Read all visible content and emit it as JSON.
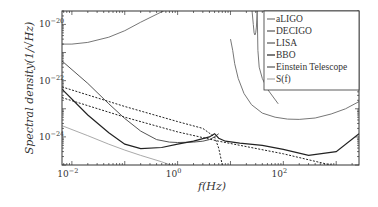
{
  "chart_data": {
    "type": "line",
    "title": "",
    "xlabel": "f(Hz)",
    "ylabel": "Spectral density(1/√Hz)",
    "xscale": "log",
    "yscale": "log",
    "xlim": [
      0.0065,
      2700
    ],
    "ylim": [
      1e-25,
      3e-20
    ],
    "x_ticks": [
      {
        "value": 0.01,
        "label": "10",
        "exp": "−2"
      },
      {
        "value": 1,
        "label": "10",
        "exp": "0"
      },
      {
        "value": 100,
        "label": "10",
        "exp": "2"
      }
    ],
    "y_ticks": [
      {
        "value": 1e-20,
        "label": "10",
        "exp": "−20"
      },
      {
        "value": 1e-22,
        "label": "10",
        "exp": "−22"
      },
      {
        "value": 1e-24,
        "label": "10",
        "exp": "−24"
      }
    ],
    "grid": false,
    "legend_position": "upper right",
    "series": [
      {
        "name": "aLIGO",
        "color": "#777777",
        "width": 1,
        "dash": "",
        "x": [
          10,
          11,
          12,
          14,
          18,
          25,
          40,
          70,
          120,
          200,
          400,
          800,
          1500,
          2700
        ],
        "y": [
          3e-21,
          1.2e-21,
          4e-22,
          1.2e-22,
          3.5e-23,
          1.4e-23,
          7e-24,
          5e-24,
          4.3e-24,
          4.2e-24,
          4.7e-24,
          6.5e-24,
          1e-23,
          1.8e-23
        ]
      },
      {
        "name": "DECIGO",
        "color": "#555555",
        "width": 1,
        "dash": "",
        "x": [
          0.0065,
          0.02,
          0.05,
          0.1,
          0.2,
          0.4,
          0.7,
          1,
          2,
          3,
          4,
          5,
          6
        ],
        "y": [
          5e-22,
          8e-23,
          1.5e-23,
          4.5e-24,
          1.6e-24,
          8e-25,
          6.5e-25,
          6.3e-25,
          6.5e-25,
          7e-25,
          8e-25,
          1e-24,
          1.3e-24
        ]
      },
      {
        "name": "LISA",
        "color": "#777777",
        "width": 1,
        "dash": "",
        "x": [
          0.0065,
          0.01,
          0.02,
          0.05,
          0.1,
          0.2,
          0.5,
          1,
          2,
          3
        ],
        "y": [
          2e-21,
          2e-21,
          2.3e-21,
          3.5e-21,
          6e-21,
          1.2e-20,
          2.8e-20,
          5.5e-20,
          1.1e-19,
          1.6e-19
        ]
      },
      {
        "name": "BBO",
        "color": "#222222",
        "width": 1.2,
        "dash": "",
        "x": [
          0.0065,
          0.02,
          0.05,
          0.1,
          0.2,
          0.5,
          1,
          2,
          4,
          5,
          6,
          8,
          15,
          40,
          100,
          300,
          1000,
          2700
        ],
        "y": [
          5e-23,
          6e-24,
          1.4e-24,
          5.5e-25,
          3.8e-25,
          4.2e-25,
          5.5e-25,
          7e-25,
          1e-24,
          1.3e-24,
          9e-25,
          7e-25,
          6e-25,
          5e-25,
          3.6e-25,
          2.2e-25,
          3e-25,
          1.3e-24
        ]
      },
      {
        "name": "Einstein Telescope",
        "color": "#777777",
        "width": 1,
        "dash": "",
        "x": [
          32,
          33,
          35,
          40,
          50,
          80
        ],
        "y": [
          3e-20,
          1.2e-21,
          3e-22,
          1.2e-22,
          5e-23,
          1.5e-23
        ]
      },
      {
        "name": "Einstein Telescope (low band)",
        "color": "#777777",
        "width": 1,
        "dash": "",
        "x": [
          25,
          27,
          28,
          29,
          30,
          31,
          32
        ],
        "y": [
          5e-20,
          1e-20,
          5e-21,
          4.2e-21,
          5e-21,
          8e-21,
          3e-20
        ]
      },
      {
        "name": "S(f)",
        "color": "#aaaaaa",
        "width": 1,
        "dash": "",
        "x": [
          0.0065,
          0.02,
          0.05,
          0.1,
          0.2,
          0.5,
          1,
          1.5,
          2,
          2.5
        ],
        "y": [
          2.5e-24,
          1.1e-24,
          5.5e-25,
          3.4e-25,
          2.2e-25,
          1.3e-25,
          8e-26,
          4e-26,
          2e-26,
          1e-26
        ]
      },
      {
        "name": "dotted-1",
        "color": "#222222",
        "width": 1,
        "dash": "2,1.5",
        "x": [
          0.0065,
          0.1,
          1,
          6,
          100,
          1000,
          2000
        ],
        "y": [
          2.5e-23,
          5e-24,
          1.5e-24,
          7e-25,
          2.5e-25,
          9e-26,
          4e-26
        ]
      },
      {
        "name": "dotted-2",
        "color": "#222222",
        "width": 1,
        "dash": "2,1.5",
        "x": [
          0.0065,
          0.1,
          1,
          3,
          5,
          6,
          7,
          8
        ],
        "y": [
          6e-23,
          1.2e-23,
          3.5e-24,
          2e-24,
          1e-24,
          4e-25,
          1e-25,
          1e-26
        ]
      }
    ]
  },
  "legend": {
    "items": [
      {
        "label": "aLIGO",
        "color": "#777777"
      },
      {
        "label": "DECIGO",
        "color": "#555555"
      },
      {
        "label": "LISA",
        "color": "#555555"
      },
      {
        "label": "BBO",
        "color": "#222222"
      },
      {
        "label": "Einstein Telescope",
        "color": "#555555"
      },
      {
        "label": "S(f)",
        "color": "#aaaaaa"
      }
    ]
  }
}
